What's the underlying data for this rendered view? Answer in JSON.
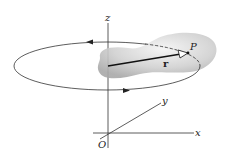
{
  "diagram": {
    "type": "rigid body rotating about z-axis",
    "labels": {
      "z_axis": "z",
      "x_axis": "x",
      "y_axis": "y",
      "origin": "O",
      "point": "P",
      "position_vector": "r"
    },
    "colors": {
      "lines": "#333333",
      "body_fill": "#c8c8c8",
      "vector": "#111111"
    }
  }
}
